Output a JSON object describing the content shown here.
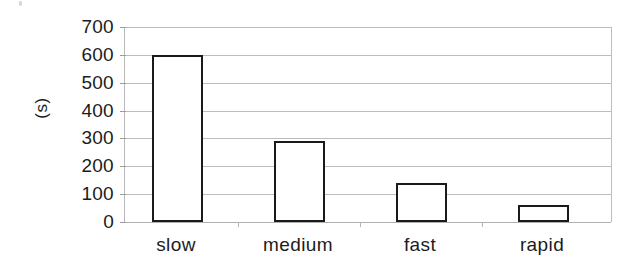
{
  "chart_data": {
    "type": "bar",
    "title": "",
    "subtitle": "",
    "xlabel": "",
    "ylabel": "(s)",
    "categories": [
      "slow",
      "medium",
      "fast",
      "rapid"
    ],
    "values": [
      600,
      290,
      140,
      60
    ],
    "series": [
      {
        "name": "time",
        "values": [
          600,
          290,
          140,
          60
        ]
      }
    ],
    "ylim": [
      0,
      700
    ],
    "ytick_step": 100,
    "ytick_labels": [
      "0",
      "100",
      "200",
      "300",
      "400",
      "500",
      "600",
      "700"
    ],
    "ytick_values": [
      0,
      100,
      200,
      300,
      400,
      500,
      600,
      700
    ],
    "grid": "horizontal",
    "legend": "none",
    "bar_fill_color": "#ffffff",
    "bar_border_color": "#1a1a1a",
    "gridline_color": "#bcbcbc",
    "axis_color": "#b9b9b9",
    "text_color": "#1c1c1c",
    "background_color": "#ffffff"
  }
}
